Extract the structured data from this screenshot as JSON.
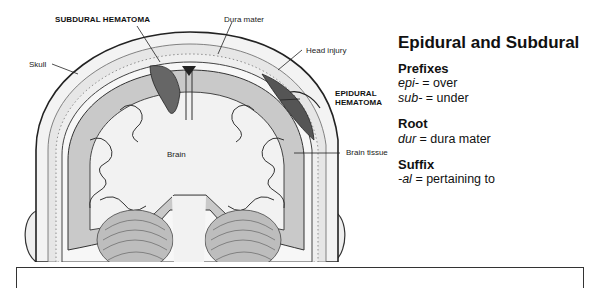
{
  "figure": {
    "labels": {
      "subdural_hematoma": "SUBDURAL HEMATOMA",
      "dura_mater": "Dura mater",
      "skull": "Skull",
      "head_injury": "Head injury",
      "epidural_hematoma_line1": "EPIDURAL",
      "epidural_hematoma_line2": "HEMATOMA",
      "brain": "Brain",
      "brain_tissue": "Brain tissue"
    }
  },
  "panel": {
    "title": "Epidural and Subdural",
    "sections": [
      {
        "heading": "Prefixes",
        "items": [
          {
            "term": "epi-",
            "definition": " = over"
          },
          {
            "term": "sub-",
            "definition": " = under"
          }
        ]
      },
      {
        "heading": "Root",
        "items": [
          {
            "term": "dur",
            "definition": " = dura mater"
          }
        ]
      },
      {
        "heading": "Suffix",
        "items": [
          {
            "term": "-al",
            "definition": " = pertaining to"
          }
        ]
      }
    ]
  }
}
